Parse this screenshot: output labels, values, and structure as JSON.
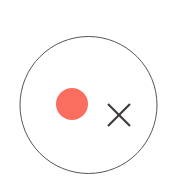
{
  "canvas": {
    "width": 181,
    "height": 192,
    "background_color": "#ffffff",
    "title": "Circle with red dot and cross marker"
  },
  "shapes": {
    "boundary_circle": {
      "name": "boundary-circle",
      "cx": 88.5,
      "cy": 105,
      "r": 68.5,
      "stroke_color": "#55555a",
      "stroke_width": 1,
      "fill": "none"
    },
    "red_dot": {
      "name": "red-dot-marker",
      "cx": 72,
      "cy": 104,
      "r": 16,
      "fill_color": "#fa6e5f",
      "stroke": "none"
    },
    "cross_marker": {
      "name": "cross-marker",
      "cx": 119,
      "cy": 115,
      "half_size": 11,
      "stroke_color": "#3e3a3a",
      "stroke_width": 2.1
    }
  }
}
